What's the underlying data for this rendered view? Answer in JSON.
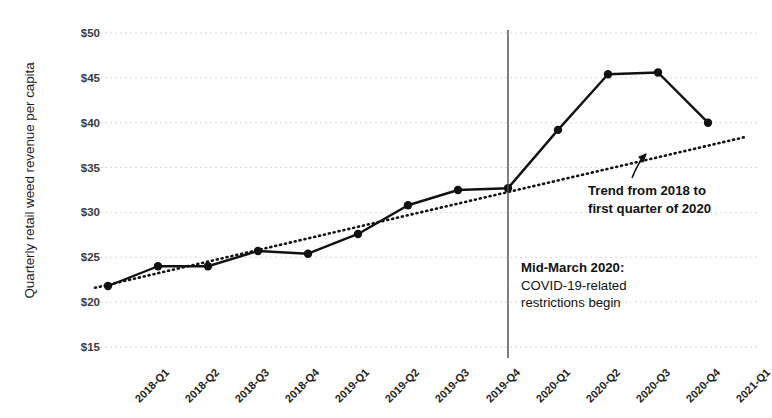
{
  "chart_data": {
    "type": "line",
    "title": "",
    "xlabel": "",
    "ylabel": "Quarterly retail weed revenue per capita",
    "ylim": [
      15,
      50
    ],
    "ytick_values": [
      15,
      20,
      25,
      30,
      35,
      40,
      45,
      50
    ],
    "ytick_labels": [
      "$15",
      "$20",
      "$25",
      "$30",
      "$35",
      "$40",
      "$45",
      "$50"
    ],
    "grid": true,
    "legend": "none",
    "categories": [
      "2018-Q1",
      "2018-Q2",
      "2018-Q3",
      "2018-Q4",
      "2019-Q1",
      "2019-Q2",
      "2019-Q3",
      "2019-Q4",
      "2020-Q1",
      "2020-Q2",
      "2020-Q3",
      "2020-Q4",
      "2021-Q1"
    ],
    "series": [
      {
        "name": "Quarterly retail weed revenue per capita",
        "style": "solid-with-markers",
        "color": "#111111",
        "values": [
          21.8,
          24.0,
          24.0,
          25.7,
          25.4,
          27.6,
          30.8,
          32.5,
          32.7,
          39.2,
          45.4,
          45.6,
          40.0
        ]
      },
      {
        "name": "Trend from 2018 to first quarter of 2020",
        "style": "dotted",
        "color": "#111111",
        "values": [
          21.6,
          23.0,
          24.4,
          25.8,
          27.2,
          28.6,
          30.0,
          31.4,
          32.8,
          34.2,
          35.6,
          37.0,
          38.4
        ]
      }
    ],
    "annotations": [
      {
        "name": "trend-annotation",
        "lines": [
          "Trend from 2018 to",
          "first quarter of 2020"
        ],
        "bold": true,
        "has_arrow": true
      },
      {
        "name": "covid-annotation",
        "lines": [
          "Mid-March 2020:",
          "COVID-19-related",
          "restrictions begin"
        ],
        "bold_first_line": true
      }
    ],
    "vertical_rule": {
      "name": "mid-march-2020-rule",
      "at_category": "2020-Q1",
      "label": "Mid-March 2020",
      "color": "#3b3b3b"
    }
  }
}
